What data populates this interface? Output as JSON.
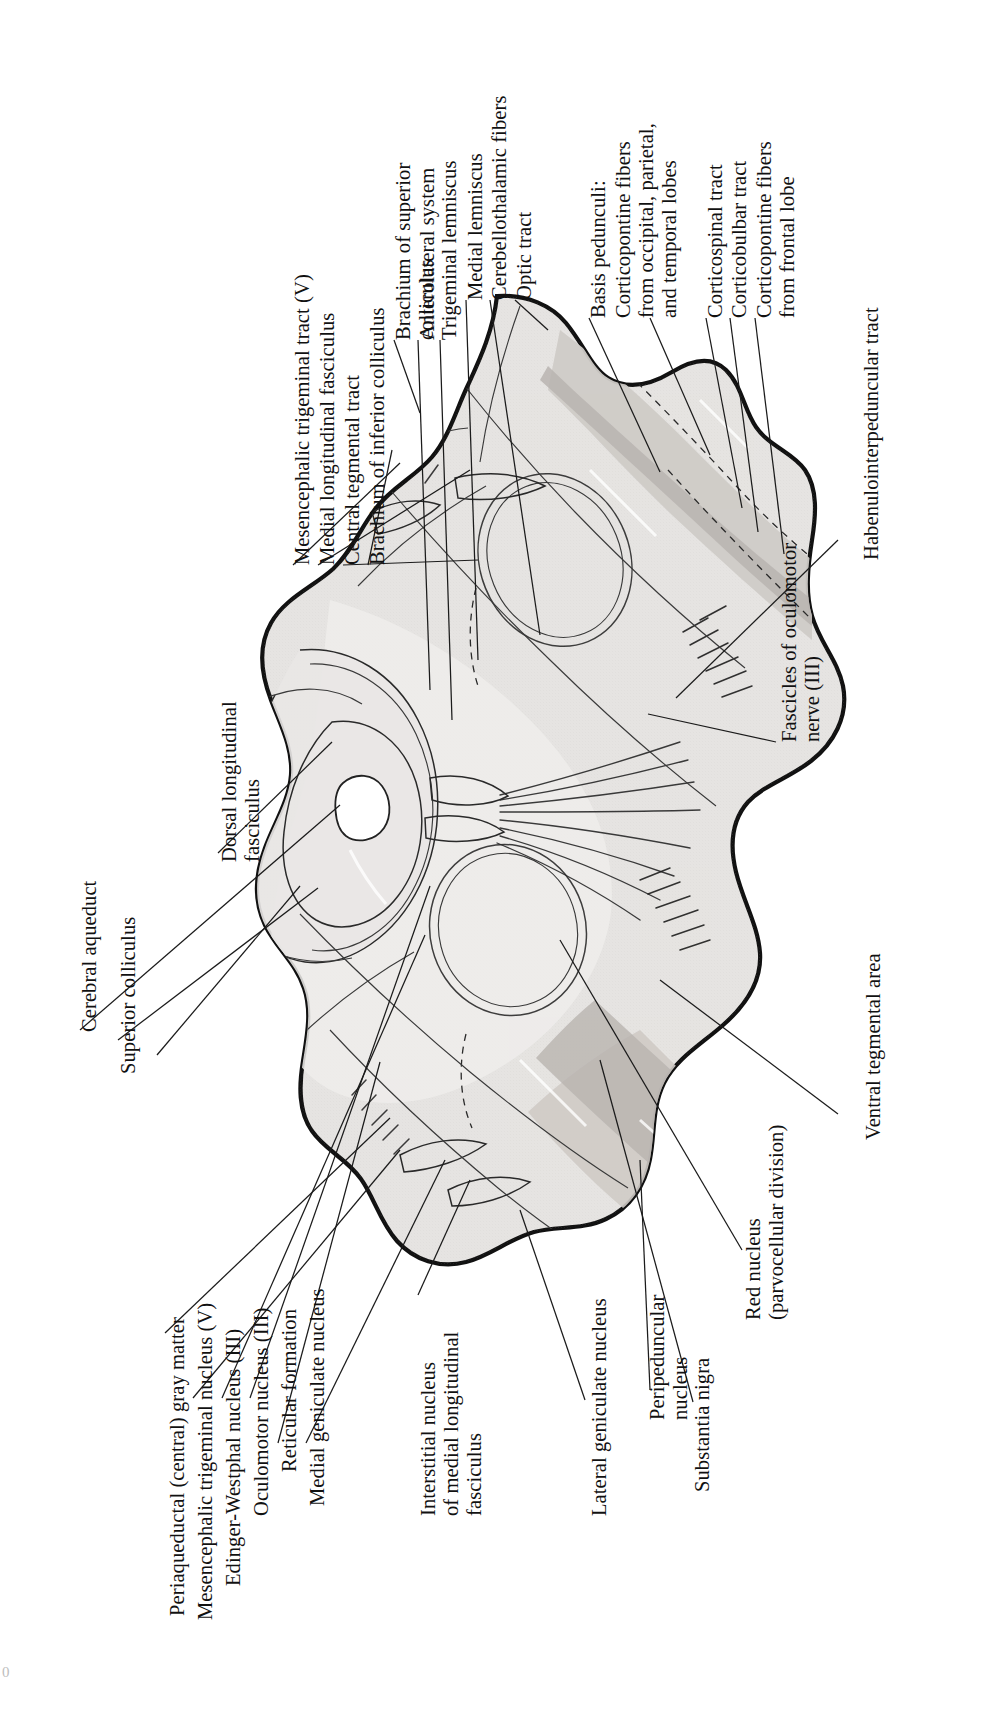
{
  "figure": {
    "orientation": "labels rotated 90 degrees counter-clockwise",
    "page_number": "0"
  },
  "labels": {
    "cerebral_aqueduct": "Cerebral aqueduct",
    "dorsal_longitudinal_fasciculus": "Dorsal longitudinal\nfasciculus",
    "mesencephalic_trigeminal_tract": "Mesencephalic trigeminal tract (V)",
    "medial_longitudinal_fasciculus": "Medial longitudinal fasciculus",
    "central_tegmental_tract": "Central tegmental tract",
    "brachium_of_inferior_colliculus": "Brachium of inferior colliculus",
    "brachium_of_superior_colliculus": "Brachium of superior\ncolliculus",
    "anterolateral_system": "Anterolateral system",
    "trigeminal_lemniscus": "Trigeminal lemniscus",
    "medial_lemniscus": "Medial lemniscus",
    "cerebellothalamic_fibers": "Cerebellothalamic fibers",
    "optic_tract": "Optic tract",
    "basis_pedunculi": "Basis pedunculi:",
    "corticopontine_occipital": "Corticopontine fibers\nfrom occipital, parietal,\nand temporal lobes",
    "corticospinal_tract": "Corticospinal tract",
    "corticobulbar_tract": "Corticobulbar tract",
    "corticopontine_frontal": "Corticopontine fibers\nfrom frontal lobe",
    "habenulointerpeduncular_tract": "Habenulointerpeduncular tract",
    "fascicles_of_oculomotor_nerve": "Fascicles of oculomotor\nnerve (III)",
    "ventral_tegmental_area": "Ventral tegmental area",
    "red_nucleus": "Red nucleus\n(parvocellular division)",
    "substantia_nigra": "Substantia nigra",
    "peripeduncular_nucleus": "Peripeduncular\nnucleus",
    "lateral_geniculate_nucleus": "Lateral geniculate nucleus",
    "interstitial_nucleus_mlf": "Interstitial nucleus\nof medial longitudinal\nfasciculus",
    "medial_geniculate_nucleus": "Medial geniculate nucleus",
    "reticular_formation": "Reticular formation",
    "oculomotor_nucleus": "Oculomotor nucleus (III)",
    "edinger_westphal_nucleus": "Edinger-Westphal nucleus (III)",
    "mesencephalic_trigeminal_nucleus": "Mesencephalic trigeminal nucleus (V)",
    "periaqueductal_gray": "Periaqueductal (central) gray matter",
    "superior_colliculus": "Superior colliculus"
  },
  "colors": {
    "ink": "#111111",
    "tissue_light": "#eceae8",
    "tissue_mid": "#d9d6d3",
    "tissue_dark": "#c6c2bf",
    "aqueduct": "#ffffff",
    "background": "#ffffff"
  }
}
